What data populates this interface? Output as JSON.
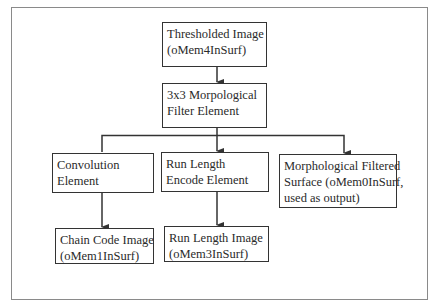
{
  "diagram": {
    "type": "flowchart",
    "nodes": {
      "thresholded": {
        "line1": "Thresholded Image",
        "line2": "(oMem4InSurf)"
      },
      "morph_filter": {
        "line1": "3x3 Morpological",
        "line2": "Filter Element"
      },
      "convolution": {
        "line1": "Convolution",
        "line2": "Element"
      },
      "rle": {
        "line1": "Run Length",
        "line2": "Encode Element"
      },
      "morph_surface": {
        "line1": "Morphological Filtered",
        "line2": "Surface (oMem0InSurf,",
        "line3": "used as output)"
      },
      "chain_code": {
        "line1": "Chain Code Image",
        "line2": "(oMem1InSurf)"
      },
      "run_length_image": {
        "line1": "Run Length Image",
        "line2": "(oMem3InSurf)"
      }
    },
    "edges": [
      {
        "from": "thresholded",
        "to": "morph_filter"
      },
      {
        "from": "morph_filter",
        "to": "convolution"
      },
      {
        "from": "morph_filter",
        "to": "rle"
      },
      {
        "from": "morph_filter",
        "to": "morph_surface"
      },
      {
        "from": "convolution",
        "to": "chain_code"
      },
      {
        "from": "rle",
        "to": "run_length_image"
      }
    ],
    "colors": {
      "line": "#333333",
      "frame": "#8a8a8a",
      "background": "#ffffff"
    }
  }
}
